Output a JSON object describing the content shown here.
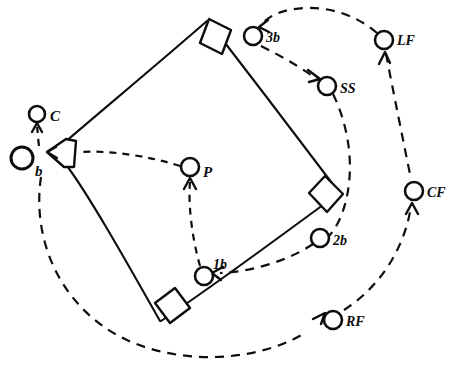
{
  "diagram": {
    "style": "hand-drawn line sketch, black ink on white",
    "labels": {
      "batter": "b",
      "catcher": "C",
      "pitcher": "P",
      "first_base": "1b",
      "second_base": "2b",
      "third_base": "3b",
      "shortstop": "SS",
      "left_field": "LF",
      "center_field": "CF",
      "right_field": "RF"
    },
    "colors": {
      "ink": "#0d0d0d",
      "paper": "#ffffff"
    },
    "players": [
      {
        "id": "batter",
        "label": "b",
        "x": 22,
        "y": 158,
        "r": 11,
        "label_dx": 13,
        "label_dy": 18
      },
      {
        "id": "catcher",
        "label": "C",
        "x": 37,
        "y": 114,
        "r": 8,
        "label_dx": 13,
        "label_dy": 7
      },
      {
        "id": "pitcher",
        "label": "P",
        "x": 190,
        "y": 167,
        "r": 9,
        "label_dx": 13,
        "label_dy": 9
      },
      {
        "id": "first_base",
        "label": "1b",
        "x": 204,
        "y": 276,
        "r": 9,
        "label_dx": 9,
        "label_dy": -7
      },
      {
        "id": "second_base",
        "label": "2b",
        "x": 320,
        "y": 238,
        "r": 9,
        "label_dx": 13,
        "label_dy": 7
      },
      {
        "id": "third_base",
        "label": "3b",
        "x": 253,
        "y": 36,
        "r": 9,
        "label_dx": 13,
        "label_dy": 6
      },
      {
        "id": "shortstop",
        "label": "SS",
        "x": 327,
        "y": 86,
        "r": 9,
        "label_dx": 13,
        "label_dy": 7
      },
      {
        "id": "left_field",
        "label": "LF",
        "x": 384,
        "y": 40,
        "r": 9,
        "label_dx": 13,
        "label_dy": 5
      },
      {
        "id": "center_field",
        "label": "CF",
        "x": 414,
        "y": 191,
        "r": 9,
        "label_dx": 13,
        "label_dy": 6
      },
      {
        "id": "right_field",
        "label": "RF",
        "x": 333,
        "y": 320,
        "r": 9,
        "label_dx": 13,
        "label_dy": 6
      }
    ],
    "bases": [
      {
        "id": "home-plate",
        "cx": 60,
        "cy": 152
      },
      {
        "id": "third-base-bag",
        "cx": 215,
        "cy": 31
      },
      {
        "id": "second-base-bag",
        "cx": 325,
        "cy": 196
      },
      {
        "id": "first-base-bag",
        "cx": 172,
        "cy": 307
      }
    ],
    "paths": {
      "infield_lines": "M 57,148 L 207,20 L 338,190 L 160,320 Z",
      "batter_to_pitcher_dash": "M 180,168 C 150,157 110,150 76,152",
      "first_to_pitcher_dash": "M 199,267 C 191,240 188,205 190,180",
      "inner_arc_3b_to_1b": "M 259,46 C 300,80 352,150 341,212 C 334,252 270,274 214,273",
      "outer_arc_b_to_cf": "M 40,176 C 35,248 95,330 190,352 C 285,372 362,345 404,282 C 424,250 420,220 416,204",
      "outer_arc_lf_top": "M 378,34 C 355,16 300,6 268,22",
      "lf_to_cf_dash": "M 384,52 C 392,95 404,140 412,178"
    },
    "arrows": [
      {
        "id": "arrow-into-home",
        "target": "home plate / batter"
      },
      {
        "id": "arrow-into-catcher",
        "target": "C"
      },
      {
        "id": "arrow-into-pitcher",
        "target": "P"
      },
      {
        "id": "arrow-into-first",
        "target": "1b baseline"
      },
      {
        "id": "arrow-into-third",
        "target": "3b"
      },
      {
        "id": "arrow-into-shortstop",
        "target": "SS"
      },
      {
        "id": "arrow-into-leftfield",
        "target": "LF"
      },
      {
        "id": "arrow-into-centerfield",
        "target": "CF"
      },
      {
        "id": "arrow-into-rightfield",
        "target": "RF"
      }
    ]
  }
}
